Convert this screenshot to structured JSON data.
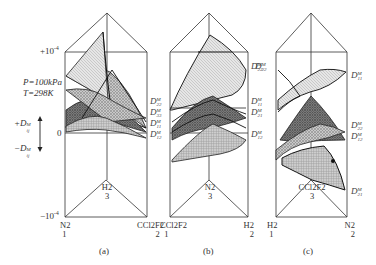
{
  "figure": {
    "conditions": {
      "pressure": "P=100kPa",
      "temperature": "T=298K"
    },
    "axis": {
      "top_tick": "+10",
      "top_tick_exp": "-4",
      "zero_tick": "0",
      "bottom_tick": "−10",
      "bottom_tick_exp": "-4",
      "positive_label": "+D",
      "negative_label": "−D",
      "label_sub": "ij",
      "label_sup": "M"
    },
    "panels": [
      {
        "id": "a",
        "caption": "(a)",
        "vertex_left": {
          "species": "N2",
          "index": "1"
        },
        "vertex_right": {
          "species": "CCl2F2",
          "index": "2"
        },
        "vertex_back": {
          "species": "H2",
          "index": "3"
        },
        "right_labels": [
          "22",
          "33",
          "11",
          "12"
        ]
      },
      {
        "id": "b",
        "caption": "(b)",
        "vertex_left": {
          "species": "CCl2F2",
          "index": "1"
        },
        "vertex_right": {
          "species": "H2",
          "index": "2"
        },
        "vertex_back": {
          "species": "N2",
          "index": "3"
        },
        "right_labels": [
          "22",
          "11",
          "21",
          "12"
        ]
      },
      {
        "id": "c",
        "caption": "(c)",
        "vertex_left": {
          "species": "H2",
          "index": "1"
        },
        "vertex_right": {
          "species": "N2",
          "index": "2"
        },
        "vertex_back": {
          "species": "CCl2F2",
          "index": "3"
        },
        "right_labels": [
          "11",
          "22",
          "12",
          "21"
        ]
      }
    ],
    "label_symbol": "D",
    "label_sup": "M"
  }
}
